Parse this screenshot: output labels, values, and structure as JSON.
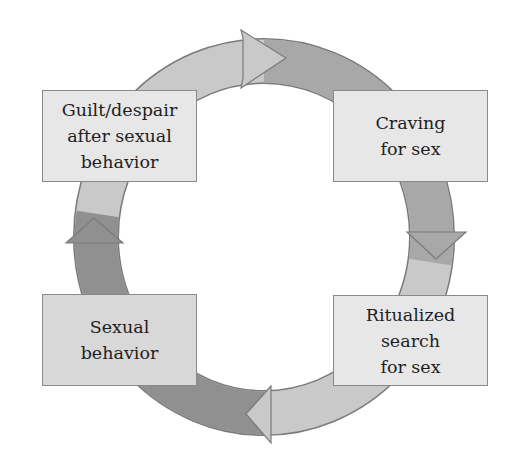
{
  "diagram": {
    "type": "cycle",
    "colors": {
      "ring_light": "#c9c9c9",
      "ring_mid": "#a6a6a6",
      "ring_dark": "#8e8e8e",
      "ring_stroke": "#7a7a7a",
      "box_light": "#e7e7e7",
      "box_dark": "#d8d8d8"
    },
    "nodes": [
      {
        "id": "guilt",
        "lines": [
          "Guilt/despair",
          "after sexual",
          "behavior"
        ]
      },
      {
        "id": "craving",
        "lines": [
          "Craving",
          "for sex"
        ]
      },
      {
        "id": "search",
        "lines": [
          "Ritualized",
          "search",
          "for sex"
        ]
      },
      {
        "id": "behavior",
        "lines": [
          "Sexual",
          "behavior"
        ]
      }
    ],
    "edges": [
      {
        "from": "guilt",
        "to": "craving",
        "arrow": "arrow-right-icon"
      },
      {
        "from": "craving",
        "to": "search",
        "arrow": "arrow-down-icon"
      },
      {
        "from": "search",
        "to": "behavior",
        "arrow": "arrow-left-icon"
      },
      {
        "from": "behavior",
        "to": "guilt",
        "arrow": "arrow-up-icon"
      }
    ]
  }
}
